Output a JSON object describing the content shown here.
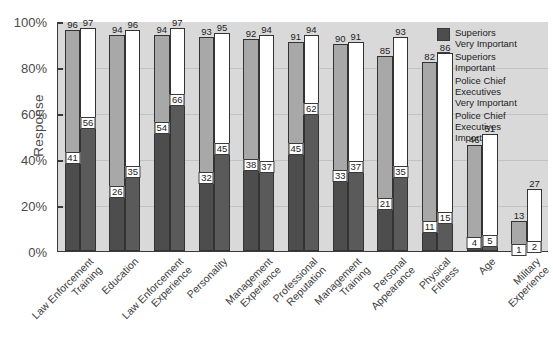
{
  "chart_data": {
    "type": "bar",
    "title": "",
    "xlabel": "",
    "ylabel": "Response",
    "ylim": [
      0,
      100
    ],
    "ytick_labels": [
      "0%",
      "20%",
      "40%",
      "60%",
      "80%",
      "100%"
    ],
    "ytick_values": [
      0,
      20,
      40,
      60,
      80,
      100
    ],
    "grid": true,
    "legend_position": "inside-top-right",
    "categories": [
      "Law Enforcement Training",
      "Education",
      "Law Enforcement Experience",
      "Personality",
      "Management Experience",
      "Professional Reputation",
      "Management Training",
      "Personal Appearance",
      "Physical Fitness",
      "Age",
      "Military Experience"
    ],
    "category_lines": [
      [
        "Law Enforcement",
        "Training"
      ],
      [
        "Education",
        ""
      ],
      [
        "Law Enforcement",
        "Experience"
      ],
      [
        "Personality",
        ""
      ],
      [
        "Management",
        "Experience"
      ],
      [
        "Professional",
        "Reputation"
      ],
      [
        "Management",
        "Training"
      ],
      [
        "Personal",
        "Appearance"
      ],
      [
        "Physical",
        "Fitness"
      ],
      [
        "Age",
        ""
      ],
      [
        "Military",
        "Experience"
      ]
    ],
    "series": [
      {
        "name": "Superiors Very Important",
        "key": "sup_vi",
        "color": "#4d4d4d",
        "values": [
          41,
          26,
          54,
          32,
          38,
          45,
          33,
          21,
          11,
          4,
          1
        ]
      },
      {
        "name": "Superiors Important",
        "key": "sup_i",
        "color": "#a8a8a8",
        "values": [
          96,
          94,
          94,
          93,
          92,
          91,
          90,
          85,
          82,
          46,
          13
        ]
      },
      {
        "name": "Police Chief Executives Very Important",
        "key": "pce_vi",
        "color": "#5a5a5a",
        "values": [
          56,
          35,
          66,
          45,
          37,
          62,
          37,
          35,
          15,
          5,
          2
        ]
      },
      {
        "name": "Police Chief Executives Important",
        "key": "pce_i",
        "color": "#ffffff",
        "values": [
          97,
          96,
          97,
          95,
          94,
          94,
          91,
          93,
          86,
          51,
          27
        ]
      }
    ]
  },
  "legend": {
    "entries": [
      {
        "label_line1": "Superiors",
        "label_line2": "Very Important",
        "label_line3": "",
        "color": "#4d4d4d"
      },
      {
        "label_line1": "Superiors",
        "label_line2": "Important",
        "label_line3": "",
        "color": "#a8a8a8"
      },
      {
        "label_line1": "Police Chief",
        "label_line2": "Executives",
        "label_line3": "Very Important",
        "color": "#5a5a5a"
      },
      {
        "label_line1": "Police Chief",
        "label_line2": "Executives",
        "label_line3": "Important",
        "color": "#ffffff"
      }
    ]
  },
  "colors": {
    "plot_background": "#d9d9d9",
    "page_background": "#ffffff",
    "axis": "#3a3a3a",
    "gridline": "#c2c2c2",
    "text": "#3c3c3c"
  }
}
